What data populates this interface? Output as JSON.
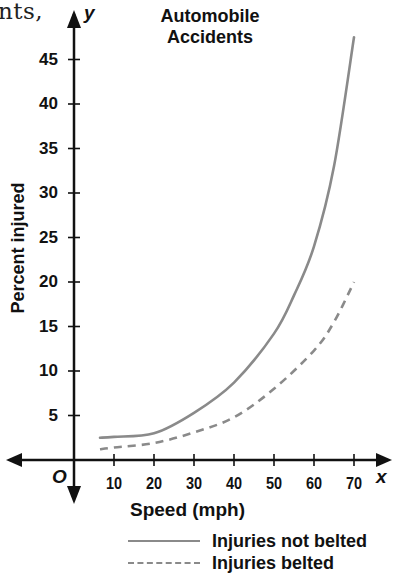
{
  "page": {
    "text_fragment": "nts,"
  },
  "chart_data": {
    "type": "line",
    "title": "Automobile Accidents",
    "title_lines": [
      "Automobile",
      "Accidents"
    ],
    "xlabel": "Speed (mph)",
    "ylabel": "Percent injured",
    "x_axis_name": "x",
    "y_axis_name": "y",
    "origin_label": "O",
    "xlim": [
      0,
      78
    ],
    "ylim": [
      0,
      50
    ],
    "xticks": [
      10,
      20,
      30,
      40,
      50,
      60,
      70
    ],
    "yticks": [
      5,
      10,
      15,
      20,
      25,
      30,
      35,
      40,
      45
    ],
    "xtick_labels": [
      "10",
      "20",
      "30",
      "40",
      "50",
      "60",
      "70"
    ],
    "ytick_labels": [
      "5",
      "10",
      "15",
      "20",
      "25",
      "30",
      "35",
      "40",
      "45"
    ],
    "grid": false,
    "legend_position": "bottom-right, below axis",
    "series": [
      {
        "name": "Injuries not belted",
        "style": "solid",
        "color": "#8a8a8a",
        "x": [
          6.5,
          10,
          20,
          30,
          40,
          50,
          55,
          60,
          65,
          70
        ],
        "y": [
          2.5,
          2.6,
          3.0,
          5.3,
          8.7,
          14.2,
          18.5,
          24,
          33,
          47.5
        ]
      },
      {
        "name": "Injuries belted",
        "style": "dashed",
        "color": "#8a8a8a",
        "x": [
          6.5,
          10,
          20,
          30,
          40,
          50,
          60,
          65,
          70
        ],
        "y": [
          1.2,
          1.4,
          1.9,
          3.1,
          4.8,
          8.0,
          12.3,
          15.5,
          20
        ]
      }
    ]
  },
  "colors": {
    "axis": "#111111",
    "curve": "#8a8a8a",
    "text": "#111111"
  }
}
